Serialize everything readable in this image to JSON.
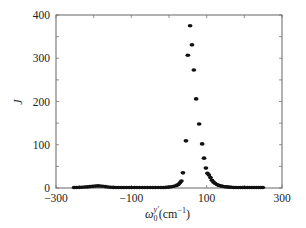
{
  "chart_data": {
    "type": "scatter",
    "title": "",
    "xlabel": "ω₀ʸ′(cm⁻¹)",
    "xlabel_parts": {
      "base": "ω",
      "sub": "0",
      "sup": "y′",
      "unit": "(cm",
      "unit_sup": "−1",
      "unit_close": ")"
    },
    "ylabel": "J",
    "xlim": [
      -300,
      300
    ],
    "ylim": [
      0,
      400
    ],
    "xticks": [
      -300,
      -100,
      100,
      300
    ],
    "xtick_labels": [
      "−300",
      "−100",
      "100",
      "300"
    ],
    "yticks": [
      0,
      100,
      200,
      300,
      400
    ],
    "ytick_labels": [
      "0",
      "100",
      "200",
      "300",
      "400"
    ],
    "grid": false,
    "legend": null,
    "marker_color": "#111111",
    "series": [
      {
        "name": "J",
        "x": [
          -252,
          -245,
          -238,
          -231,
          -224,
          -217,
          -210,
          -203,
          -196,
          -189,
          -183,
          -176,
          -169,
          -162,
          -155,
          -148,
          -141,
          -134,
          -127,
          -120,
          -113,
          -106,
          -99,
          -92,
          -85,
          -78,
          -71,
          -64,
          -57,
          -50,
          -43,
          -36,
          -29,
          -22,
          -15,
          -8,
          -1,
          6,
          13,
          20,
          25,
          29,
          33,
          37,
          45,
          50,
          56,
          61,
          66,
          72,
          80,
          88,
          93,
          98,
          102,
          106,
          110,
          114,
          118,
          122,
          127,
          132,
          137,
          142,
          148,
          154,
          160,
          166,
          172,
          178,
          184,
          190,
          196,
          202,
          208,
          214,
          220,
          226,
          232,
          238,
          244,
          249
        ],
        "y": [
          1,
          1.2,
          1.5,
          1.8,
          2.2,
          2.6,
          3.2,
          3.8,
          4.4,
          4.8,
          4.6,
          4,
          3.2,
          2.4,
          1.8,
          1.4,
          1.2,
          1,
          1,
          1,
          1,
          1,
          1,
          1,
          1,
          1,
          1,
          1,
          1,
          1,
          1,
          1,
          1,
          1,
          1.2,
          1.5,
          2,
          2.8,
          4,
          6,
          8,
          12,
          16,
          35,
          109,
          307,
          375,
          331,
          273,
          206,
          148,
          102,
          69,
          46,
          34,
          30,
          24,
          18,
          14,
          11,
          8,
          6,
          5,
          4,
          3,
          2.5,
          2,
          1.6,
          1.3,
          1.1,
          1,
          1,
          1,
          1,
          1,
          1,
          1,
          1,
          1,
          1,
          1,
          1
        ]
      }
    ]
  }
}
